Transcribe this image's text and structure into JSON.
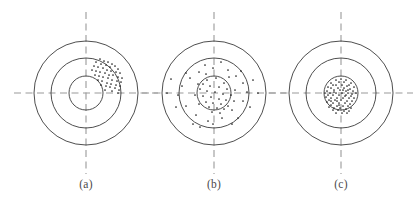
{
  "figure": {
    "type": "target-scatter-diagram",
    "background_color": "#ffffff",
    "width": 415,
    "height": 210,
    "ring_stroke_color": "#3a3a3a",
    "crosshair_color": "#9a9a9a",
    "dot_color": "#1d1d1d",
    "dot_radius": 0.85,
    "ring_radii": [
      52,
      35,
      17
    ],
    "crosshair": {
      "horizontal_half_length": 72,
      "vertical_half_length": 81,
      "dash_pattern": "7 4.5"
    }
  },
  "panels": [
    {
      "id": "a",
      "label": "(a)",
      "label_x": 86,
      "label_y": 186,
      "center_x": 86,
      "center_y": 93,
      "description": "clustered off-center group of shots in upper-right between inner and middle rings",
      "dot_count": 46,
      "dots": [
        [
          100,
          59
        ],
        [
          104,
          61
        ],
        [
          108,
          62
        ],
        [
          112,
          64
        ],
        [
          96,
          62
        ],
        [
          101,
          64
        ],
        [
          106,
          65
        ],
        [
          110,
          67
        ],
        [
          115,
          66
        ],
        [
          118,
          69
        ],
        [
          94,
          66
        ],
        [
          98,
          67
        ],
        [
          103,
          68
        ],
        [
          107,
          70
        ],
        [
          111,
          71
        ],
        [
          116,
          72
        ],
        [
          120,
          73
        ],
        [
          92,
          70
        ],
        [
          96,
          71
        ],
        [
          100,
          72
        ],
        [
          105,
          73
        ],
        [
          109,
          75
        ],
        [
          113,
          75
        ],
        [
          118,
          77
        ],
        [
          122,
          78
        ],
        [
          95,
          75
        ],
        [
          99,
          76
        ],
        [
          103,
          77
        ],
        [
          108,
          78
        ],
        [
          112,
          80
        ],
        [
          117,
          81
        ],
        [
          121,
          82
        ],
        [
          98,
          80
        ],
        [
          102,
          81
        ],
        [
          107,
          83
        ],
        [
          111,
          84
        ],
        [
          116,
          85
        ],
        [
          120,
          86
        ],
        [
          101,
          85
        ],
        [
          106,
          86
        ],
        [
          110,
          87
        ],
        [
          115,
          88
        ],
        [
          119,
          90
        ],
        [
          105,
          90
        ],
        [
          112,
          91
        ],
        [
          118,
          93
        ]
      ]
    },
    {
      "id": "b",
      "label": "(b)",
      "label_x": 214,
      "label_y": 186,
      "center_x": 214,
      "center_y": 93,
      "description": "shots centered on target but widely scattered across all rings",
      "dot_count": 62,
      "dots": [
        [
          213,
          68
        ],
        [
          228,
          70
        ],
        [
          199,
          72
        ],
        [
          236,
          76
        ],
        [
          190,
          78
        ],
        [
          221,
          62
        ],
        [
          205,
          65
        ],
        [
          243,
          83
        ],
        [
          182,
          86
        ],
        [
          247,
          92
        ],
        [
          178,
          95
        ],
        [
          243,
          101
        ],
        [
          186,
          106
        ],
        [
          232,
          110
        ],
        [
          196,
          115
        ],
        [
          222,
          118
        ],
        [
          208,
          121
        ],
        [
          213,
          124
        ],
        [
          200,
          127
        ],
        [
          232,
          124
        ],
        [
          176,
          107
        ],
        [
          250,
          107
        ],
        [
          167,
          93
        ],
        [
          258,
          93
        ],
        [
          186,
          73
        ],
        [
          241,
          71
        ],
        [
          171,
          79
        ],
        [
          253,
          80
        ],
        [
          193,
          124
        ],
        [
          238,
          118
        ],
        [
          207,
          80
        ],
        [
          216,
          78
        ],
        [
          224,
          83
        ],
        [
          203,
          84
        ],
        [
          210,
          86
        ],
        [
          219,
          87
        ],
        [
          227,
          89
        ],
        [
          200,
          89
        ],
        [
          207,
          91
        ],
        [
          215,
          92
        ],
        [
          223,
          94
        ],
        [
          231,
          95
        ],
        [
          203,
          96
        ],
        [
          211,
          97
        ],
        [
          219,
          99
        ],
        [
          226,
          100
        ],
        [
          206,
          102
        ],
        [
          213,
          103
        ],
        [
          221,
          104
        ],
        [
          228,
          106
        ],
        [
          209,
          107
        ],
        [
          217,
          108
        ],
        [
          224,
          109
        ],
        [
          212,
          112
        ],
        [
          220,
          113
        ],
        [
          199,
          104
        ],
        [
          234,
          101
        ],
        [
          195,
          95
        ],
        [
          235,
          90
        ],
        [
          198,
          84
        ],
        [
          229,
          77
        ],
        [
          206,
          74
        ]
      ]
    },
    {
      "id": "c",
      "label": "(c)",
      "label_x": 341,
      "label_y": 186,
      "center_x": 341,
      "center_y": 93,
      "description": "shots tightly grouped in the bullseye, both accurate and precise",
      "dot_count": 74,
      "dots": [
        [
          341,
          79
        ],
        [
          336,
          80
        ],
        [
          346,
          80
        ],
        [
          331,
          83
        ],
        [
          351,
          83
        ],
        [
          339,
          82
        ],
        [
          344,
          82
        ],
        [
          333,
          85
        ],
        [
          349,
          85
        ],
        [
          328,
          87
        ],
        [
          354,
          87
        ],
        [
          336,
          85
        ],
        [
          342,
          85
        ],
        [
          347,
          86
        ],
        [
          331,
          88
        ],
        [
          338,
          88
        ],
        [
          344,
          88
        ],
        [
          350,
          89
        ],
        [
          327,
          91
        ],
        [
          334,
          90
        ],
        [
          340,
          90
        ],
        [
          346,
          91
        ],
        [
          353,
          91
        ],
        [
          356,
          93
        ],
        [
          325,
          93
        ],
        [
          330,
          93
        ],
        [
          336,
          93
        ],
        [
          342,
          93
        ],
        [
          348,
          93
        ],
        [
          352,
          94
        ],
        [
          328,
          95
        ],
        [
          333,
          95
        ],
        [
          339,
          95
        ],
        [
          345,
          96
        ],
        [
          351,
          96
        ],
        [
          326,
          97
        ],
        [
          331,
          98
        ],
        [
          337,
          98
        ],
        [
          343,
          98
        ],
        [
          349,
          98
        ],
        [
          354,
          98
        ],
        [
          329,
          100
        ],
        [
          335,
          100
        ],
        [
          341,
          100
        ],
        [
          347,
          101
        ],
        [
          352,
          101
        ],
        [
          327,
          102
        ],
        [
          333,
          103
        ],
        [
          339,
          103
        ],
        [
          345,
          103
        ],
        [
          350,
          104
        ],
        [
          331,
          105
        ],
        [
          337,
          106
        ],
        [
          343,
          106
        ],
        [
          348,
          106
        ],
        [
          329,
          107
        ],
        [
          334,
          108
        ],
        [
          340,
          108
        ],
        [
          346,
          109
        ],
        [
          351,
          108
        ],
        [
          333,
          110
        ],
        [
          338,
          110
        ],
        [
          344,
          111
        ],
        [
          349,
          111
        ],
        [
          336,
          113
        ],
        [
          342,
          113
        ],
        [
          347,
          113
        ],
        [
          339,
          105
        ],
        [
          334,
          92
        ],
        [
          346,
          95
        ],
        [
          343,
          90
        ],
        [
          337,
          101
        ],
        [
          348,
          90
        ],
        [
          331,
          101
        ]
      ]
    }
  ]
}
